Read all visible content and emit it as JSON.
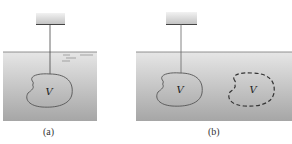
{
  "figure": {
    "panels": [
      {
        "id": "a",
        "caption": "(a)",
        "object_label": "V",
        "description": "Object of volume V suspended by a string from a support, submerged in fluid; surface ripple marks on water"
      },
      {
        "id": "b",
        "caption": "(b)",
        "object_label": "V",
        "ghost_label": "V",
        "description": "Suspended object of volume V beside a dashed outline of an equal-volume region of fluid"
      }
    ],
    "colors": {
      "water_top": "#e4e4e4",
      "water_bottom": "#a8a8a8",
      "object_fill": "#bdbdbd",
      "outline": "#555555",
      "support": "#d6d6d6"
    }
  }
}
